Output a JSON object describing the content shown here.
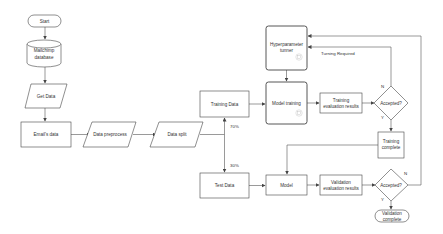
{
  "diagram": {
    "type": "flowchart",
    "colors": {
      "stroke": "#444444",
      "text": "#333333",
      "fill": "#ffffff",
      "icon": "#bbbbbb"
    },
    "nodes": {
      "start": {
        "label": "Start",
        "shape": "terminal"
      },
      "database": {
        "label_line1": "Mailchimp",
        "label_line2": "database",
        "shape": "cylinder"
      },
      "get_data": {
        "label": "Get Data",
        "shape": "parallelogram"
      },
      "emails_data": {
        "label": "Email's data",
        "shape": "rectangle"
      },
      "data_preprocess": {
        "label": "Data preprocess",
        "shape": "parallelogram"
      },
      "data_split": {
        "label": "Data split",
        "shape": "parallelogram"
      },
      "training_data": {
        "label": "Training Data",
        "shape": "rectangle"
      },
      "test_data": {
        "label": "Test Data",
        "shape": "rectangle"
      },
      "hyperparameter_tuner": {
        "label_line1": "Hyperparameter",
        "label_line2": "tunner",
        "shape": "rounded-rectangle",
        "icon": "robot-icon"
      },
      "model_training": {
        "label": "Model training",
        "shape": "rounded-rectangle",
        "icon": "robot-icon"
      },
      "training_eval": {
        "label_line1": "Training",
        "label_line2": "evaluation results",
        "shape": "rectangle"
      },
      "accepted_training": {
        "label": "Accepted?",
        "shape": "diamond"
      },
      "training_complete": {
        "label_line1": "Training",
        "label_line2": "complete",
        "shape": "rectangle"
      },
      "model": {
        "label": "Model",
        "shape": "rectangle"
      },
      "validation_eval": {
        "label_line1": "Validation",
        "label_line2": "evaluation results",
        "shape": "rectangle"
      },
      "accepted_validation": {
        "label": "Accepted?",
        "shape": "diamond"
      },
      "validation_complete": {
        "label_line1": "Validation",
        "label_line2": "complete",
        "shape": "terminal"
      }
    },
    "edge_labels": {
      "split_train": "70%",
      "split_test": "30%",
      "tuning_required": "Turning Required",
      "train_no": "N",
      "train_yes": "Y",
      "val_no": "N",
      "val_yes": "Y"
    },
    "edges": [
      {
        "from": "start",
        "to": "database"
      },
      {
        "from": "database",
        "to": "get_data"
      },
      {
        "from": "get_data",
        "to": "emails_data"
      },
      {
        "from": "emails_data",
        "to": "data_preprocess"
      },
      {
        "from": "data_preprocess",
        "to": "data_split"
      },
      {
        "from": "data_split",
        "to": "training_data",
        "label": "70%"
      },
      {
        "from": "data_split",
        "to": "test_data",
        "label": "30%"
      },
      {
        "from": "training_data",
        "to": "model_training"
      },
      {
        "from": "hyperparameter_tuner",
        "to": "model_training"
      },
      {
        "from": "model_training",
        "to": "training_eval"
      },
      {
        "from": "training_eval",
        "to": "accepted_training"
      },
      {
        "from": "accepted_training",
        "to": "hyperparameter_tuner",
        "label": "N / Turning Required"
      },
      {
        "from": "accepted_training",
        "to": "training_complete",
        "label": "Y"
      },
      {
        "from": "training_complete",
        "to": "model"
      },
      {
        "from": "test_data",
        "to": "model"
      },
      {
        "from": "model",
        "to": "validation_eval"
      },
      {
        "from": "validation_eval",
        "to": "accepted_validation"
      },
      {
        "from": "accepted_validation",
        "to": "hyperparameter_tuner",
        "label": "N"
      },
      {
        "from": "accepted_validation",
        "to": "validation_complete",
        "label": "Y"
      }
    ]
  }
}
